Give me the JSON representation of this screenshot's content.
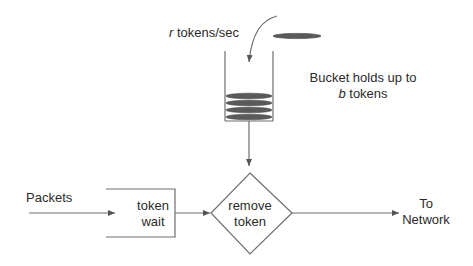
{
  "diagram": {
    "rate_label": {
      "var": "r",
      "text": " tokens/sec"
    },
    "bucket_label": {
      "line1": "Bucket holds up to",
      "var": "b",
      "line2_rest": " tokens"
    },
    "input_label": "Packets",
    "queue_box": {
      "line1": "token",
      "line2": "wait"
    },
    "decision": {
      "line1": "remove",
      "line2": "token"
    },
    "output_label": {
      "line1": "To",
      "line2": "Network"
    },
    "tokens_in_bucket": 4,
    "colors": {
      "line": "#6e6e6e",
      "token_fill": "#5a5a5a",
      "text": "#2a2a2a"
    }
  }
}
